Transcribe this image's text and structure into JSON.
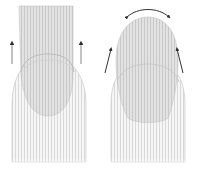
{
  "figure": {
    "panels": [
      {
        "id": "left",
        "label": "",
        "arrows": "straight-up"
      },
      {
        "id": "right",
        "label": "",
        "arrows": "curved-outward"
      }
    ]
  },
  "colors": {
    "background": "#ffffff",
    "finger_fill": "#f2f2f2",
    "finger_stripe": "#d8d8d8",
    "finger_outline": "#c8c8c8",
    "nail_fill": "#dcdcdc",
    "nail_outline": "#bdbdbd",
    "arrow": "#333333",
    "arrow_shaft": "#9a9a9a"
  }
}
